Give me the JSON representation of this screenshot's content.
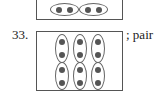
{
  "problems": [
    {
      "number": "",
      "answer": "",
      "groups": 2,
      "items_per_group": 2,
      "orientation": "horizontal"
    },
    {
      "number": "33.",
      "answer": "; pair",
      "groups": 6,
      "items_per_group": 2,
      "orientation": "vertical"
    }
  ],
  "colors": {
    "dot": "#555555",
    "border": "#555555",
    "oval": "#666666"
  }
}
